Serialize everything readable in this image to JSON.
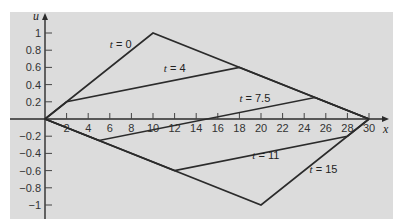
{
  "chart_data": {
    "type": "line",
    "title": "",
    "xlabel": "x",
    "ylabel": "u",
    "xlim": [
      0,
      31
    ],
    "ylim": [
      -1.1,
      1.2
    ],
    "x_ticks": [
      2,
      4,
      6,
      8,
      10,
      12,
      14,
      16,
      18,
      20,
      22,
      24,
      26,
      28,
      30
    ],
    "x_tick_labels": [
      "2",
      "4",
      "6",
      "8",
      "10",
      "12",
      "14",
      "16",
      "18",
      "20",
      "22",
      "24",
      "26",
      "28",
      "30"
    ],
    "y_ticks": [
      1,
      0.8,
      0.6,
      0.4,
      0.2,
      -0.2,
      -0.4,
      -0.6,
      -0.8,
      -1
    ],
    "y_tick_labels": [
      "1",
      "0.8",
      "0.6",
      "0.4",
      "0.2",
      "−0.2",
      "−0.4",
      "−0.6",
      "−0.8",
      "−1"
    ],
    "grid": false,
    "legend": "inline labels",
    "series": [
      {
        "name": "t = 0",
        "x": [
          0,
          10,
          30
        ],
        "y": [
          0,
          1,
          0
        ],
        "label_pos": [
          6,
          0.82
        ]
      },
      {
        "name": "t = 4",
        "x": [
          0,
          2,
          18,
          30
        ],
        "y": [
          0,
          0.2,
          0.6,
          0
        ],
        "label_pos": [
          11,
          0.55
        ]
      },
      {
        "name": "t = 7.5",
        "x": [
          0,
          5,
          25,
          30
        ],
        "y": [
          0,
          -0.25,
          0.25,
          0
        ],
        "label_pos": [
          18,
          0.2
        ]
      },
      {
        "name": "t = 11",
        "x": [
          0,
          12,
          28,
          30
        ],
        "y": [
          0,
          -0.6,
          -0.2,
          0
        ],
        "label_pos": [
          19.2,
          -0.46
        ]
      },
      {
        "name": "t = 15",
        "x": [
          0,
          20,
          30
        ],
        "y": [
          0,
          -1,
          0
        ],
        "label_pos": [
          24.5,
          -0.63
        ]
      }
    ]
  },
  "labels": {
    "x_axis": "x",
    "y_axis": "u",
    "t0": {
      "var": "t",
      "rest": " = 0"
    },
    "t4": {
      "var": "t",
      "rest": " = 4"
    },
    "t75": {
      "var": "t",
      "rest": " = 7.5"
    },
    "t11": {
      "var": "t",
      "rest": " = 11"
    },
    "t15": {
      "var": "t",
      "rest": " = 15"
    }
  },
  "colors": {
    "panel": "#dcdcdc",
    "line": "#2b2b2b"
  }
}
